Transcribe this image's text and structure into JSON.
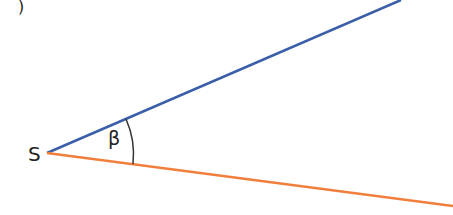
{
  "diagram": {
    "vertex_label": "S",
    "angle_label": "β",
    "partial_label": ")",
    "colors": {
      "ray_upper": "#3a5ea8",
      "ray_lower": "#f07f3c",
      "arc": "#333333",
      "text": "#222222"
    },
    "vertex": [
      47,
      153
    ],
    "ray_upper_end": [
      401,
      0
    ],
    "ray_lower_end": [
      453,
      206
    ]
  }
}
